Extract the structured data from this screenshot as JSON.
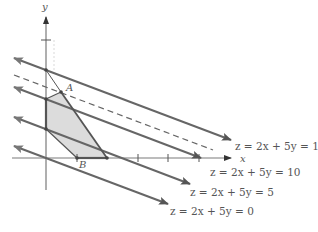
{
  "axes": {
    "x_label": "x",
    "y_label": "y"
  },
  "points": {
    "A": "A",
    "B": "B"
  },
  "level_lines": [
    {
      "label": "z = 2x + 5y = 15",
      "z": 15,
      "style": "solid"
    },
    {
      "label": "",
      "z": null,
      "style": "dashed"
    },
    {
      "label": "z = 2x + 5y = 10",
      "z": 10,
      "style": "solid"
    },
    {
      "label": "z = 2x + 5y = 5",
      "z": 5,
      "style": "solid"
    },
    {
      "label": "z = 2x + 5y = 0",
      "z": 0,
      "style": "solid"
    }
  ],
  "colors": {
    "line": "#666666",
    "axis": "#7a7a7a",
    "region_fill": "#dcdcdc",
    "region_edge": "#555555"
  }
}
